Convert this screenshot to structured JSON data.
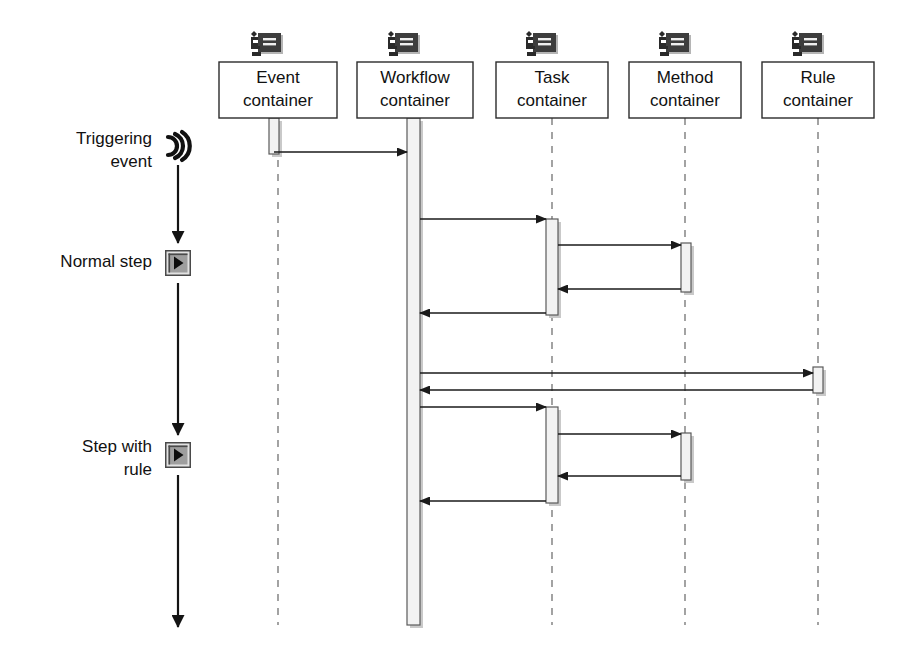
{
  "diagram": {
    "kind": "uml-sequence-diagram",
    "width": 908,
    "height": 656,
    "background_color": "#ffffff"
  },
  "lifelines": [
    {
      "id": "event",
      "label_line1": "Event",
      "label_line2": "container",
      "icon": "component-node-icon",
      "center_x": 278,
      "box": {
        "x": 219,
        "y": 62,
        "w": 118,
        "h": 56
      },
      "lifeline_bottom": 625
    },
    {
      "id": "workflow",
      "label_line1": "Workflow",
      "label_line2": "container",
      "icon": "component-node-icon",
      "center_x": 414,
      "box": {
        "x": 357,
        "y": 62,
        "w": 116,
        "h": 56
      },
      "lifeline_bottom": 625
    },
    {
      "id": "task",
      "label_line1": "Task",
      "label_line2": "container",
      "icon": "component-node-icon",
      "center_x": 552,
      "box": {
        "x": 496,
        "y": 62,
        "w": 112,
        "h": 56
      },
      "lifeline_bottom": 625
    },
    {
      "id": "method",
      "label_line1": "Method",
      "label_line2": "container",
      "icon": "component-node-icon",
      "center_x": 685,
      "box": {
        "x": 629,
        "y": 62,
        "w": 112,
        "h": 56
      },
      "lifeline_bottom": 625
    },
    {
      "id": "rule",
      "label_line1": "Rule",
      "label_line2": "container",
      "icon": "component-node-icon",
      "center_x": 818,
      "box": {
        "x": 762,
        "y": 62,
        "w": 112,
        "h": 56
      },
      "lifeline_bottom": 625
    }
  ],
  "activations": [
    {
      "id": "event-activation",
      "lifeline": "event",
      "x": 269,
      "y": 118,
      "w": 10,
      "h": 36
    },
    {
      "id": "workflow-activation",
      "lifeline": "workflow",
      "x": 407,
      "y": 118,
      "w": 13,
      "h": 507
    },
    {
      "id": "task-activation-1",
      "lifeline": "task",
      "x": 546,
      "y": 219,
      "w": 12,
      "h": 96
    },
    {
      "id": "method-activation-1",
      "lifeline": "method",
      "x": 681,
      "y": 243,
      "w": 10,
      "h": 49
    },
    {
      "id": "rule-activation",
      "lifeline": "rule",
      "x": 813,
      "y": 367,
      "w": 10,
      "h": 26
    },
    {
      "id": "task-activation-2",
      "lifeline": "task",
      "x": 546,
      "y": 407,
      "w": 12,
      "h": 96
    },
    {
      "id": "method-activation-2",
      "lifeline": "method",
      "x": 681,
      "y": 433,
      "w": 10,
      "h": 47
    }
  ],
  "messages": [
    {
      "id": "m1",
      "from": "event",
      "to": "workflow",
      "y": 152,
      "direction": "right",
      "style": "solid",
      "note": "triggering event delivered to workflow container"
    },
    {
      "id": "m2",
      "from": "workflow",
      "to": "task",
      "y": 219,
      "direction": "right",
      "style": "solid",
      "note": "normal step invoke task"
    },
    {
      "id": "m3",
      "from": "task",
      "to": "method",
      "y": 245,
      "direction": "right",
      "style": "solid",
      "note": "task invoke method"
    },
    {
      "id": "m4",
      "from": "method",
      "to": "task",
      "y": 289,
      "direction": "left",
      "style": "solid",
      "note": "method returns to task"
    },
    {
      "id": "m5",
      "from": "task",
      "to": "workflow",
      "y": 313,
      "direction": "left",
      "style": "solid",
      "note": "task returns to workflow"
    },
    {
      "id": "m6",
      "from": "workflow",
      "to": "rule",
      "y": 373,
      "direction": "right",
      "style": "solid",
      "note": "workflow evaluates rule"
    },
    {
      "id": "m7",
      "from": "rule",
      "to": "workflow",
      "y": 390,
      "direction": "left",
      "style": "solid",
      "note": "rule result returned"
    },
    {
      "id": "m8",
      "from": "workflow",
      "to": "task",
      "y": 407,
      "direction": "right",
      "style": "solid",
      "note": "step with rule invoke task"
    },
    {
      "id": "m9",
      "from": "task",
      "to": "method",
      "y": 434,
      "direction": "right",
      "style": "solid",
      "note": "task invoke method"
    },
    {
      "id": "m10",
      "from": "method",
      "to": "task",
      "y": 476,
      "direction": "left",
      "style": "solid",
      "note": "method returns to task"
    },
    {
      "id": "m11",
      "from": "task",
      "to": "workflow",
      "y": 501,
      "direction": "left",
      "style": "solid",
      "note": "task returns to workflow"
    }
  ],
  "steps": [
    {
      "id": "triggering-event",
      "label_line1": "Triggering",
      "label_line2": "event",
      "icon": "signal-wave-icon",
      "label_x": 152,
      "label_y": 146,
      "icon_x": 178,
      "icon_y": 147
    },
    {
      "id": "normal-step",
      "label_line1": "Normal step",
      "label_line2": "",
      "icon": "play-button-icon",
      "label_x": 152,
      "label_y": 263,
      "icon_x": 178,
      "icon_y": 263
    },
    {
      "id": "step-with-rule",
      "label_line1": "Step with",
      "label_line2": "rule",
      "icon": "play-button-icon",
      "label_x": 152,
      "label_y": 455,
      "icon_x": 178,
      "icon_y": 455
    }
  ],
  "flow_arrows": [
    {
      "id": "flow-arrow-1",
      "x": 178,
      "y1": 163,
      "y2": 243,
      "note": "triggering event to normal step"
    },
    {
      "id": "flow-arrow-2",
      "x": 178,
      "y1": 283,
      "y2": 435,
      "note": "normal step to step with rule"
    },
    {
      "id": "flow-arrow-3",
      "x": 178,
      "y1": 475,
      "y2": 627,
      "note": "step with rule onward"
    }
  ],
  "colors": {
    "background": "#ffffff",
    "box_stroke": "#2b2b2b",
    "lifeline_dash": "#8c8c8c",
    "activation_fill": "#f2f2f2",
    "activation_stroke": "#5a5a5a",
    "activation_shadow": "#c9c9c9",
    "message_stroke": "#1a1a1a",
    "text": "#111111",
    "icon_body": "#3d3d3d",
    "button_face": "#9e9e9e"
  }
}
